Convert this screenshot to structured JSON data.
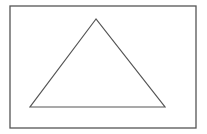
{
  "diagram": {
    "type": "geometric-figure",
    "canvas": {
      "width": 207,
      "height": 134,
      "background": "#ffffff"
    },
    "frame": {
      "shape": "rectangle",
      "x": 10,
      "y": 6,
      "width": 186,
      "height": 122,
      "stroke": "#555555",
      "stroke_width": 1.3,
      "fill": "none"
    },
    "shapes": [
      {
        "shape": "triangle",
        "points": [
          [
            96,
            19
          ],
          [
            30,
            107
          ],
          [
            165,
            107
          ]
        ],
        "stroke": "#555555",
        "stroke_width": 1.2,
        "fill": "none"
      }
    ]
  }
}
